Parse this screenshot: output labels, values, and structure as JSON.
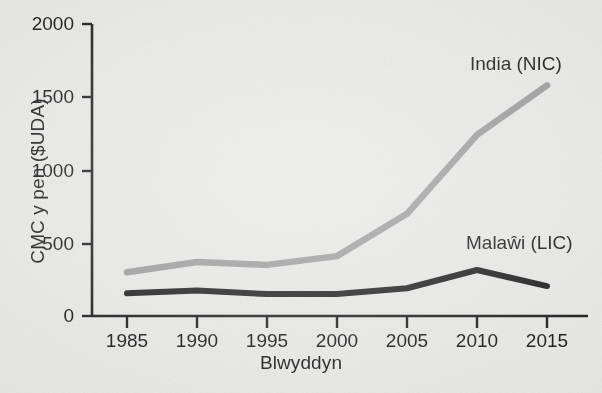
{
  "figure": {
    "kind": "line-graph",
    "language": "cy"
  },
  "axes": {
    "x_label": "Blwyddyn",
    "y_label": "CMC y pen ($UDA)",
    "y_ticks": [
      "0",
      "500",
      "1000",
      "1500",
      "2000"
    ],
    "x_ticks": [
      "1985",
      "1990",
      "1995",
      "2000",
      "2005",
      "2010",
      "2015"
    ]
  },
  "series_labels": {
    "india": "India (NIC)",
    "malawi": "Malaŵi (LIC)"
  },
  "colors": {
    "india_line": "#9a9a9a",
    "malawi_line": "#1c1c1c",
    "axis": "#1b1b1b",
    "background": "#e8e8e6"
  },
  "chart_data": {
    "type": "line",
    "title": "",
    "xlabel": "Blwyddyn",
    "ylabel": "CMC y pen ($UDA)",
    "x": [
      1985,
      1990,
      1995,
      2000,
      2005,
      2010,
      2015
    ],
    "xlim": [
      1983,
      2017
    ],
    "ylim": [
      0,
      2000
    ],
    "ytick_values": [
      0,
      500,
      1000,
      1500,
      2000
    ],
    "xtick_values": [
      1985,
      1990,
      1995,
      2000,
      2005,
      2010,
      2015
    ],
    "grid": false,
    "legend": "inline-annotations",
    "series": [
      {
        "name": "India (NIC)",
        "color": "#9a9a9a",
        "values": [
          300,
          370,
          350,
          410,
          700,
          1240,
          1580
        ]
      },
      {
        "name": "Malaŵi (LIC)",
        "color": "#1c1c1c",
        "values": [
          155,
          175,
          150,
          150,
          190,
          315,
          205
        ]
      }
    ],
    "annotations": [
      {
        "text": "India (NIC)",
        "x": 2011.5,
        "y": 1760
      },
      {
        "text": "Malaŵi (LIC)",
        "x": 2011.5,
        "y": 500
      }
    ]
  }
}
